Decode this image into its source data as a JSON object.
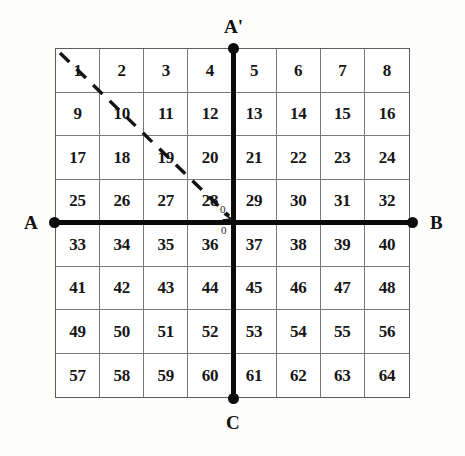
{
  "figure": {
    "title": "",
    "background_color": "#fdfdfc",
    "grid": {
      "rows": 8,
      "cols": 8,
      "cell_values": [
        "1",
        "2",
        "3",
        "4",
        "5",
        "6",
        "7",
        "8",
        "9",
        "10",
        "11",
        "12",
        "13",
        "14",
        "15",
        "16",
        "17",
        "18",
        "19",
        "20",
        "21",
        "22",
        "23",
        "24",
        "25",
        "26",
        "27",
        "28",
        "29",
        "30",
        "31",
        "32",
        "33",
        "34",
        "35",
        "36",
        "37",
        "38",
        "39",
        "40",
        "41",
        "42",
        "43",
        "44",
        "45",
        "46",
        "47",
        "48",
        "49",
        "50",
        "51",
        "52",
        "53",
        "54",
        "55",
        "56",
        "57",
        "58",
        "59",
        "60",
        "61",
        "62",
        "63",
        "64"
      ],
      "line_color": "#7a7a7a",
      "border_color": "#5d5d5d",
      "cell_background": "#ffffff"
    },
    "axes": {
      "color": "#0b0b0b",
      "horizontal": {
        "left_label": "A",
        "right_label": "B"
      },
      "vertical": {
        "top_label": "A'",
        "bottom_label": "C"
      },
      "origin_labels": {
        "upper": "0",
        "lower": "0"
      }
    },
    "diagonal": {
      "style": "dashed",
      "color": "#141414",
      "from_cell": "1",
      "to_cell": "28",
      "description": "dashed diagonal from top-left corner of cell 1 to origin at bottom-right corner of cell 28"
    }
  }
}
